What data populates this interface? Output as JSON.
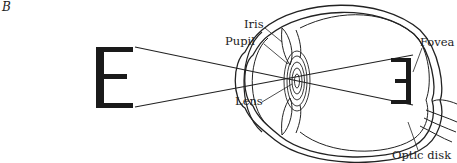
{
  "panel_label": "B",
  "object_letter": "E",
  "labels": {
    "iris": "Iris",
    "pupil": "Pupil",
    "lens": "Lens",
    "fovea": "Fovea",
    "optic_disk": "Optic disk"
  }
}
